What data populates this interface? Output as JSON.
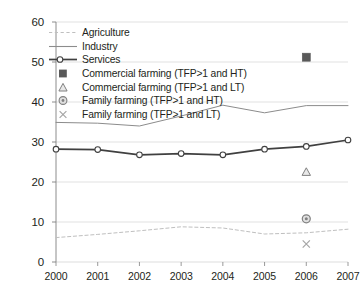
{
  "chart_data": {
    "type": "line",
    "title": "",
    "subtitle": "",
    "xlabel": "",
    "ylabel": "",
    "categories": [
      "2000",
      "2001",
      "2002",
      "2003",
      "2004",
      "2005",
      "2006",
      "2007"
    ],
    "x": [
      2000,
      2001,
      2002,
      2003,
      2004,
      2005,
      2006,
      2007
    ],
    "xlim": [
      2000,
      2007
    ],
    "ylim": [
      0,
      60
    ],
    "yticks": [
      0,
      10,
      20,
      30,
      40,
      50,
      60
    ],
    "xticks": [
      "2000",
      "2001",
      "2002",
      "2003",
      "2004",
      "2005",
      "2006",
      "2007"
    ],
    "grid": "horizontal",
    "legend_position": "upper-left-inside",
    "series": [
      {
        "name": "Agriculture",
        "style": "dashed-line",
        "color": "#bfbfbf",
        "marker": "none",
        "values": [
          6.1,
          6.9,
          7.8,
          8.8,
          8.5,
          7.0,
          7.3,
          8.2
        ]
      },
      {
        "name": "Industry",
        "style": "solid-line",
        "color": "#8c8c8c",
        "marker": "none",
        "values": [
          34.9,
          34.7,
          34.0,
          36.5,
          39.2,
          37.3,
          39.1,
          39.1
        ]
      },
      {
        "name": "Services",
        "style": "solid-line-markers",
        "color": "#404040",
        "marker": "open-circle",
        "values": [
          28.2,
          28.1,
          26.8,
          27.1,
          26.8,
          28.2,
          28.9,
          30.5
        ]
      },
      {
        "name": "Commercial farming (TFP>1 and HT)",
        "style": "point-only",
        "color": "#595959",
        "marker": "filled-square",
        "points": [
          {
            "x": 2006,
            "y": 51.2
          }
        ]
      },
      {
        "name": "Commercial farming (TFP>1 and LT)",
        "style": "point-only",
        "color": "#808080",
        "marker": "open-triangle",
        "points": [
          {
            "x": 2006,
            "y": 22.5
          }
        ]
      },
      {
        "name": "Family farming (TFP>1 and HT)",
        "style": "point-only",
        "color": "#808080",
        "marker": "circle-dot",
        "points": [
          {
            "x": 2006,
            "y": 10.8
          }
        ]
      },
      {
        "name": "Family farming (TFP>1 and LT)",
        "style": "point-only",
        "color": "#a6a6a6",
        "marker": "cross-x",
        "points": [
          {
            "x": 2006,
            "y": 4.5
          }
        ]
      }
    ]
  },
  "legend": {
    "items": [
      {
        "label": "Agriculture",
        "key": "dashed-line-key"
      },
      {
        "label": "Industry",
        "key": "solid-line-key"
      },
      {
        "label": "Services",
        "key": "line-circle-key"
      },
      {
        "label": "Commercial farming (TFP>1 and HT)",
        "key": "filled-square-key"
      },
      {
        "label": "Commercial farming (TFP>1 and LT)",
        "key": "open-triangle-key"
      },
      {
        "label": "Family farming (TFP>1 and HT)",
        "key": "circle-dot-key"
      },
      {
        "label": "Family farming (TFP>1 and LT)",
        "key": "cross-x-key"
      }
    ]
  },
  "axis": {
    "y_labels": [
      "60",
      "50",
      "40",
      "30",
      "20",
      "10",
      "0"
    ],
    "x_labels": [
      "2000",
      "2001",
      "2002",
      "2003",
      "2004",
      "2005",
      "2006",
      "2007"
    ]
  },
  "colors": {
    "grid": "#d9d9d9",
    "axis": "#808080",
    "text": "#231f20",
    "agriculture": "#bfbfbf",
    "industry": "#8c8c8c",
    "services": "#404040"
  }
}
